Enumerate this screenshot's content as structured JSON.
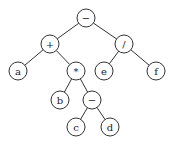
{
  "diagram": {
    "type": "expression-tree",
    "nodes": [
      {
        "id": "n0",
        "label": "−",
        "x": 86,
        "y": 18
      },
      {
        "id": "n1",
        "label": "+",
        "x": 50,
        "y": 44
      },
      {
        "id": "n2",
        "label": "/",
        "x": 124,
        "y": 44
      },
      {
        "id": "n3",
        "label": "a",
        "x": 18,
        "y": 71
      },
      {
        "id": "n4",
        "label": "*",
        "x": 76,
        "y": 71
      },
      {
        "id": "n5",
        "label": "e",
        "x": 104,
        "y": 71
      },
      {
        "id": "n6",
        "label": "f",
        "x": 156,
        "y": 71
      },
      {
        "id": "n7",
        "label": "b",
        "x": 60,
        "y": 100
      },
      {
        "id": "n8",
        "label": "−",
        "x": 92,
        "y": 100
      },
      {
        "id": "n9",
        "label": "c",
        "x": 76,
        "y": 127
      },
      {
        "id": "n10",
        "label": "d",
        "x": 110,
        "y": 127
      }
    ],
    "edges": [
      [
        "n0",
        "n1"
      ],
      [
        "n0",
        "n2"
      ],
      [
        "n1",
        "n3"
      ],
      [
        "n1",
        "n4"
      ],
      [
        "n2",
        "n5"
      ],
      [
        "n2",
        "n6"
      ],
      [
        "n4",
        "n7"
      ],
      [
        "n4",
        "n8"
      ],
      [
        "n8",
        "n9"
      ],
      [
        "n8",
        "n10"
      ]
    ],
    "node_radius": 9
  }
}
